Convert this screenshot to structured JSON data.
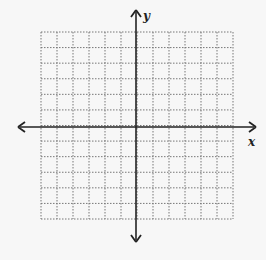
{
  "diagram": {
    "type": "coordinate-plane",
    "x_axis_label": "x",
    "y_axis_label": "y",
    "grid": {
      "columns": 12,
      "rows": 12,
      "line_style": "dotted",
      "line_color": "#777777"
    },
    "axis_color": "#222222",
    "background": "#f7f7f7"
  }
}
